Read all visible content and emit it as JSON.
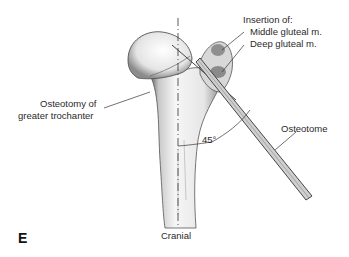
{
  "figure": {
    "panel_letter": "E",
    "labels": {
      "insertion_title": "Insertion of:",
      "middle_gluteal": "Middle gluteal m.",
      "deep_gluteal": "Deep gluteal m.",
      "osteotomy_line1": "Osteotomy of",
      "osteotomy_line2": "greater trochanter",
      "osteotome": "Osteotome",
      "angle": "45°",
      "orientation": "Cranial"
    },
    "colors": {
      "line": "#333333",
      "bone_shade": "#9a9a9a",
      "muscle_insertion": "#7a7a7a"
    }
  }
}
